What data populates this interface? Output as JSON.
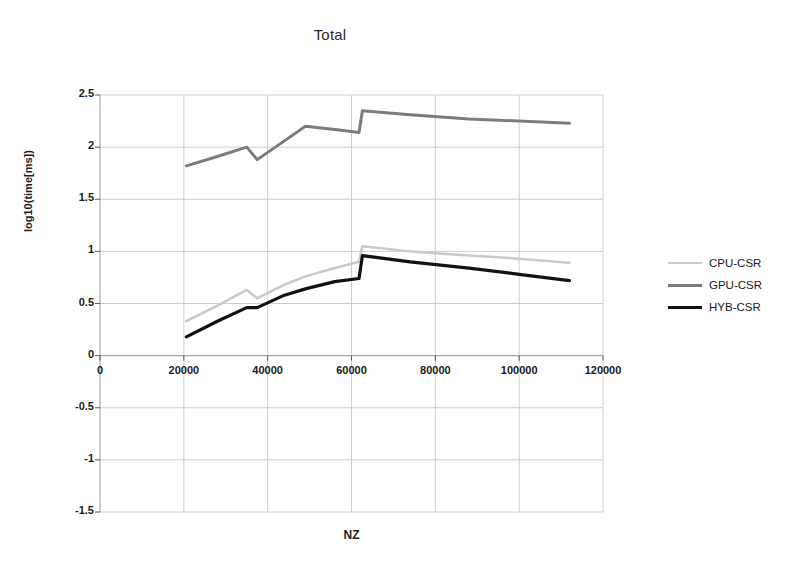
{
  "chart_data": {
    "type": "line",
    "title": "Total",
    "xlabel": "NZ",
    "ylabel": "log10(time[ms])",
    "xlim": [
      0,
      120000
    ],
    "ylim": [
      -1.5,
      2.5
    ],
    "xticks": [
      0,
      20000,
      40000,
      60000,
      80000,
      100000,
      120000
    ],
    "xtick_labels": [
      "0",
      "20000",
      "40000",
      "60000",
      "80000",
      "100000",
      "120000"
    ],
    "yticks": [
      -1.5,
      -1,
      -0.5,
      0,
      0.5,
      1,
      1.5,
      2,
      2.5
    ],
    "ytick_labels": [
      "-1.5",
      "-1",
      "-0.5",
      "0",
      "0.5",
      "1",
      "1.5",
      "2",
      "2.5"
    ],
    "grid": true,
    "legend_position": "right",
    "series": [
      {
        "name": "CPU-CSR",
        "color": "#c9c9c9",
        "width": 2.5,
        "x": [
          20600,
          28000,
          35000,
          37500,
          44000,
          49000,
          56000,
          61800,
          62600,
          74000,
          88000,
          100000,
          112000
        ],
        "y": [
          0.33,
          0.48,
          0.63,
          0.55,
          0.68,
          0.76,
          0.84,
          0.9,
          1.05,
          1.0,
          0.96,
          0.93,
          0.89
        ]
      },
      {
        "name": "GPU-CSR",
        "color": "#7c7c7c",
        "width": 3,
        "x": [
          20600,
          28000,
          35000,
          37500,
          44000,
          49000,
          56000,
          61800,
          62600,
          74000,
          88000,
          100000,
          112000
        ],
        "y": [
          1.82,
          1.91,
          2.0,
          1.88,
          2.06,
          2.2,
          2.17,
          2.14,
          2.35,
          2.31,
          2.27,
          2.25,
          2.23
        ]
      },
      {
        "name": "HYB-CSR",
        "color": "#111111",
        "width": 3.2,
        "x": [
          20600,
          28000,
          35000,
          37500,
          44000,
          49000,
          56000,
          61800,
          62600,
          74000,
          88000,
          100000,
          112000
        ],
        "y": [
          0.18,
          0.33,
          0.46,
          0.46,
          0.58,
          0.64,
          0.71,
          0.74,
          0.96,
          0.9,
          0.84,
          0.78,
          0.72
        ]
      }
    ]
  },
  "legend": {
    "items": [
      {
        "label": "CPU-CSR",
        "color": "#c9c9c9",
        "width": 2.5
      },
      {
        "label": "GPU-CSR",
        "color": "#7c7c7c",
        "width": 3
      },
      {
        "label": "HYB-CSR",
        "color": "#111111",
        "width": 3.2
      }
    ]
  }
}
